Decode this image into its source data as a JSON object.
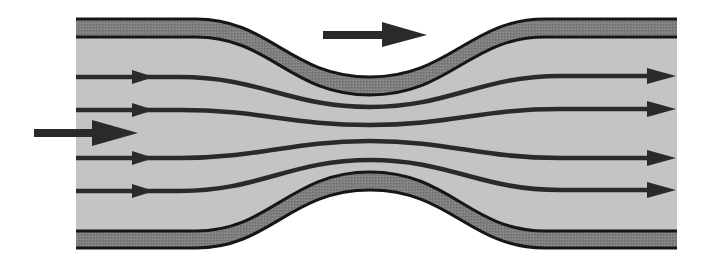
{
  "diagram": {
    "title": "Streamlines through a pipe constriction (Venturi)",
    "colors": {
      "background": "#ffffff",
      "fluid": "#c4c4c4",
      "wall_fill": "#808080",
      "wall_edge": "#161616",
      "streamline": "#2a2a2a",
      "arrow": "#2a2a2a"
    },
    "pipe": {
      "left_x": 76,
      "right_x": 677,
      "inlet_top_outer_y": 19,
      "inlet_top_inner_y": 37,
      "inlet_bottom_inner_y": 231,
      "inlet_bottom_outer_y": 248,
      "throat_x": 370,
      "throat_top_outer_y": 77,
      "throat_top_inner_y": 95,
      "throat_bottom_inner_y": 172,
      "throat_bottom_outer_y": 190
    },
    "streamlines": [
      {
        "id": "s1",
        "inlet_y": 77,
        "throat_y": 107,
        "outlet_y": 76
      },
      {
        "id": "s2",
        "inlet_y": 110,
        "throat_y": 125,
        "outlet_y": 109
      },
      {
        "id": "s3",
        "inlet_y": 158,
        "throat_y": 141,
        "outlet_y": 158
      },
      {
        "id": "s4",
        "inlet_y": 191,
        "throat_y": 160,
        "outlet_y": 190
      }
    ],
    "arrows": {
      "inflow": {
        "label": "inflow direction",
        "x1": 34,
        "x2": 138,
        "y": 133
      },
      "flow_direction_top": {
        "label": "flow direction",
        "x1": 323,
        "x2": 427,
        "y": 35
      }
    }
  }
}
